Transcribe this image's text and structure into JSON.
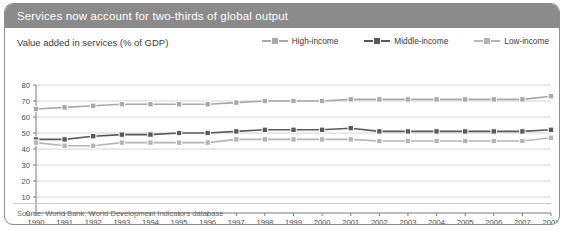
{
  "figure": {
    "title": "Services now account for two-thirds of global output",
    "subtitle": "Value added in services (% of GDP)",
    "source": "Source: World Bank, World Development Indicators database",
    "header_color": "#8b8b8b",
    "border_color": "#8e8e8e"
  },
  "chart_data": {
    "type": "line",
    "title": "Services now account for two-thirds of global output",
    "subtitle": "Value added in services (% of GDP)",
    "xlabel": "",
    "ylabel": "",
    "ylim": [
      0,
      80
    ],
    "yticks": [
      0,
      10,
      20,
      30,
      40,
      50,
      60,
      70,
      80
    ],
    "grid": true,
    "legend_position": "top-right",
    "categories": [
      "1990",
      "1991",
      "1992",
      "1993",
      "1994",
      "1995",
      "1996",
      "1997",
      "1998",
      "1999",
      "2000",
      "2001",
      "2002",
      "2003",
      "2004",
      "2005",
      "2006",
      "2007",
      "2008"
    ],
    "series": [
      {
        "name": "High-income",
        "color": "#a8a8a8",
        "marker": "square",
        "values": [
          65,
          66,
          67,
          68,
          68,
          68,
          68,
          69,
          70,
          70,
          70,
          71,
          71,
          71,
          71,
          71,
          71,
          71,
          73
        ]
      },
      {
        "name": "Middle-income",
        "color": "#595959",
        "marker": "square",
        "values": [
          46,
          46,
          48,
          49,
          49,
          50,
          50,
          51,
          52,
          52,
          52,
          53,
          51,
          51,
          51,
          51,
          51,
          51,
          52
        ]
      },
      {
        "name": "Low-income",
        "color": "#b5b5b5",
        "marker": "square",
        "values": [
          44,
          42,
          42,
          44,
          44,
          44,
          44,
          46,
          46,
          46,
          46,
          46,
          45,
          45,
          45,
          45,
          45,
          45,
          47
        ]
      }
    ]
  }
}
